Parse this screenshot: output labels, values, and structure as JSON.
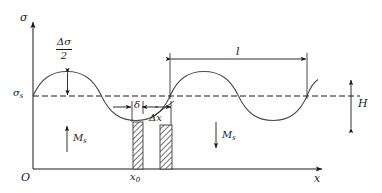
{
  "figure": {
    "type": "stress-distribution-diagram",
    "axes": {
      "y_axis_label": "σ",
      "x_axis_label": "x",
      "origin_label": "O",
      "baseline_label_symbol": "σ",
      "baseline_label_subscript": "s"
    },
    "annotations": {
      "amplitude_numerator": "Δσ",
      "amplitude_denominator": "2",
      "wavelength_label": "l",
      "height_label": "H",
      "delta_label": "δ",
      "delta_x_label": "Δx",
      "position_label_symbol": "x",
      "position_label_subscript": "0",
      "moment_left_symbol": "M",
      "moment_left_subscript": "s",
      "moment_right_symbol": "M",
      "moment_right_subscript": "s"
    },
    "colors": {
      "line": "#1a1a1a",
      "curve": "#4a4a4a",
      "hatch": "#555555",
      "background": "#ffffff"
    },
    "curve": {
      "kind": "sinusoid",
      "baseline_y": 96,
      "peak_y": 72,
      "trough_y": 120,
      "wavelength_px": 137,
      "x_start": 33,
      "x_end": 318
    },
    "bars": [
      {
        "name": "bar-left",
        "x": 133,
        "width": 10,
        "y_top": 122,
        "y_bottom": 169
      },
      {
        "name": "bar-right",
        "x": 160,
        "width": 12,
        "y_top": 125,
        "y_bottom": 169
      }
    ]
  }
}
